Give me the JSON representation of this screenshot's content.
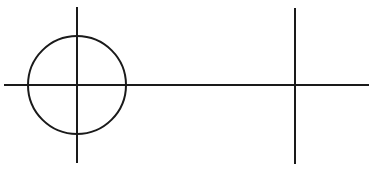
{
  "diagram": {
    "background": "#ffffff",
    "stroke_color": "#1a1a1a",
    "stroke_width": 2,
    "elements": {
      "horizontal_axis": {
        "x1": 4,
        "y1": 85,
        "x2": 369,
        "y2": 85
      },
      "left_vertical": {
        "x1": 77,
        "y1": 7,
        "x2": 77,
        "y2": 163
      },
      "circle": {
        "cx": 77,
        "cy": 85,
        "r": 49
      },
      "right_vertical": {
        "x1": 295,
        "y1": 8,
        "x2": 295,
        "y2": 164
      }
    }
  }
}
